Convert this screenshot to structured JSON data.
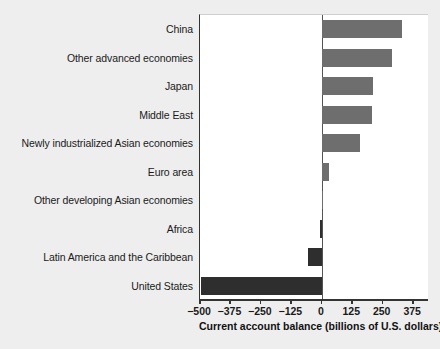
{
  "chart_data": {
    "type": "bar",
    "orientation": "horizontal",
    "title": "",
    "xlabel": "Current account balance (billions of U.S. dollars)",
    "ylabel": "",
    "xlim": [
      -500,
      440
    ],
    "xticks": [
      -500,
      -375,
      -250,
      -125,
      0,
      125,
      250,
      375
    ],
    "xticklabels": [
      "−500",
      "−375",
      "−250",
      "−125",
      "0",
      "125",
      "250",
      "375"
    ],
    "grid": false,
    "legend": null,
    "categories": [
      "China",
      "Other advanced economies",
      "Japan",
      "Middle East",
      "Newly industrialized Asian economies",
      "Euro area",
      "Other developing Asian economies",
      "Africa",
      "Latin America and the Caribbean",
      "United States"
    ],
    "values": [
      330,
      288,
      210,
      208,
      155,
      30,
      3,
      -8,
      -55,
      -495
    ],
    "colors": {
      "positive_bar": "#6e6e6e",
      "negative_bar": "#2e2e2e",
      "background": "#eeeeee",
      "plot_background": "#ffffff",
      "axis": "#333333"
    }
  }
}
